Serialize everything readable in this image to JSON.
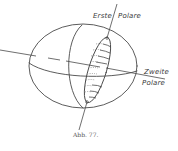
{
  "figure": {
    "caption": "Abb. 77.",
    "labels": {
      "first_polar": "Erste",
      "first_polar_2": "Polare",
      "second_polar": "Zweite",
      "second_polar_2": "Polare"
    },
    "colors": {
      "ink": "#4a4a4a",
      "background": "#ffffff"
    }
  }
}
